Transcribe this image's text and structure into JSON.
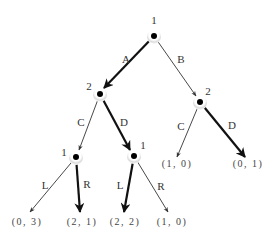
{
  "diagram": {
    "type": "extensive-form game tree",
    "nodes": [
      {
        "id": "root",
        "player": "1",
        "x": 154,
        "y": 36,
        "label_x": 154,
        "label_y": 20
      },
      {
        "id": "p2_left",
        "player": "2",
        "x": 100,
        "y": 94,
        "label_x": 89,
        "label_y": 86
      },
      {
        "id": "p2_right",
        "player": "2",
        "x": 200,
        "y": 102,
        "label_x": 208,
        "label_y": 91
      },
      {
        "id": "p1_left",
        "player": "1",
        "x": 76,
        "y": 157,
        "label_x": 64,
        "label_y": 152
      },
      {
        "id": "p1_mid",
        "player": "1",
        "x": 134,
        "y": 156,
        "label_x": 143,
        "label_y": 145
      }
    ],
    "edges": [
      {
        "label": "A",
        "from": [
          154,
          36
        ],
        "to": [
          104,
          88
        ],
        "bold": true,
        "label_x": 126,
        "label_y": 59
      },
      {
        "label": "B",
        "from": [
          154,
          36
        ],
        "to": [
          196,
          96
        ],
        "bold": false,
        "label_x": 181,
        "label_y": 59
      },
      {
        "label": "C",
        "from": [
          100,
          94
        ],
        "to": [
          79,
          150
        ],
        "bold": false,
        "label_x": 81,
        "label_y": 122
      },
      {
        "label": "D",
        "from": [
          100,
          94
        ],
        "to": [
          130,
          150
        ],
        "bold": true,
        "label_x": 124,
        "label_y": 122
      },
      {
        "label": "C",
        "from": [
          200,
          102
        ],
        "to": [
          177,
          157
        ],
        "bold": false,
        "label_x": 181,
        "label_y": 126
      },
      {
        "label": "D",
        "from": [
          200,
          102
        ],
        "to": [
          245,
          157
        ],
        "bold": true,
        "label_x": 232,
        "label_y": 125
      },
      {
        "label": "L",
        "from": [
          76,
          157
        ],
        "to": [
          30,
          212
        ],
        "bold": false,
        "label_x": 45,
        "label_y": 185
      },
      {
        "label": "R",
        "from": [
          76,
          157
        ],
        "to": [
          80,
          212
        ],
        "bold": true,
        "label_x": 87,
        "label_y": 184
      },
      {
        "label": "L",
        "from": [
          134,
          156
        ],
        "to": [
          124,
          212
        ],
        "bold": true,
        "label_x": 120,
        "label_y": 185
      },
      {
        "label": "R",
        "from": [
          134,
          156
        ],
        "to": [
          168,
          212
        ],
        "bold": false,
        "label_x": 161,
        "label_y": 186
      }
    ],
    "payoffs": [
      {
        "text": "(0, 3)",
        "x": 27,
        "y": 222
      },
      {
        "text": "(2, 1)",
        "x": 82,
        "y": 222
      },
      {
        "text": "(2, 2)",
        "x": 125,
        "y": 222
      },
      {
        "text": "(1, 0)",
        "x": 172,
        "y": 222
      },
      {
        "text": "(1, 0)",
        "x": 177,
        "y": 164
      },
      {
        "text": "(0, 1)",
        "x": 248,
        "y": 164
      }
    ],
    "colors": {
      "line": "#333333",
      "bold_line": "#111111",
      "node": "#000000",
      "background": "#ffffff"
    }
  }
}
